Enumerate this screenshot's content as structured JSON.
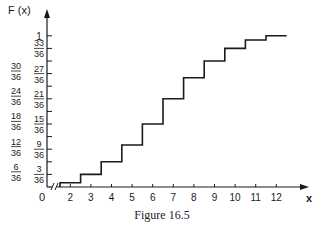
{
  "chart_data": {
    "type": "line",
    "subtype": "step-cdf",
    "title": "",
    "caption": "Figure 16.5",
    "xlabel": "x",
    "ylabel": "F (x)",
    "x_ticks": [
      2,
      3,
      4,
      5,
      6,
      7,
      8,
      9,
      10,
      11,
      12
    ],
    "x_origin_label": "0",
    "x_axis_break": true,
    "y_ticks": [
      {
        "num": "3",
        "den": "36",
        "value": 0.0833
      },
      {
        "num": "6",
        "den": "36",
        "value": 0.1667
      },
      {
        "num": "9",
        "den": "36",
        "value": 0.25
      },
      {
        "num": "12",
        "den": "36",
        "value": 0.3333
      },
      {
        "num": "15",
        "den": "36",
        "value": 0.4167
      },
      {
        "num": "18",
        "den": "36",
        "value": 0.5
      },
      {
        "num": "21",
        "den": "36",
        "value": 0.5833
      },
      {
        "num": "24",
        "den": "36",
        "value": 0.6667
      },
      {
        "num": "27",
        "den": "36",
        "value": 0.75
      },
      {
        "num": "30",
        "den": "36",
        "value": 0.8333
      },
      {
        "num": "33",
        "den": "36",
        "value": 0.9167
      },
      {
        "num": "1",
        "den": "",
        "value": 1.0
      }
    ],
    "steps": [
      {
        "x_start": 1.5,
        "x_end": 2.5,
        "F_36ths": 1
      },
      {
        "x_start": 2.5,
        "x_end": 3.5,
        "F_36ths": 3
      },
      {
        "x_start": 3.5,
        "x_end": 4.5,
        "F_36ths": 6
      },
      {
        "x_start": 4.5,
        "x_end": 5.5,
        "F_36ths": 10
      },
      {
        "x_start": 5.5,
        "x_end": 6.5,
        "F_36ths": 15
      },
      {
        "x_start": 6.5,
        "x_end": 7.5,
        "F_36ths": 21
      },
      {
        "x_start": 7.5,
        "x_end": 8.5,
        "F_36ths": 26
      },
      {
        "x_start": 8.5,
        "x_end": 9.5,
        "F_36ths": 30
      },
      {
        "x_start": 9.5,
        "x_end": 10.5,
        "F_36ths": 33
      },
      {
        "x_start": 10.5,
        "x_end": 11.5,
        "F_36ths": 35
      },
      {
        "x_start": 11.5,
        "x_end": 12.5,
        "F_36ths": 36
      }
    ],
    "ylim": [
      0,
      1
    ],
    "xlim": [
      0,
      13
    ],
    "grid": false,
    "legend": null
  }
}
